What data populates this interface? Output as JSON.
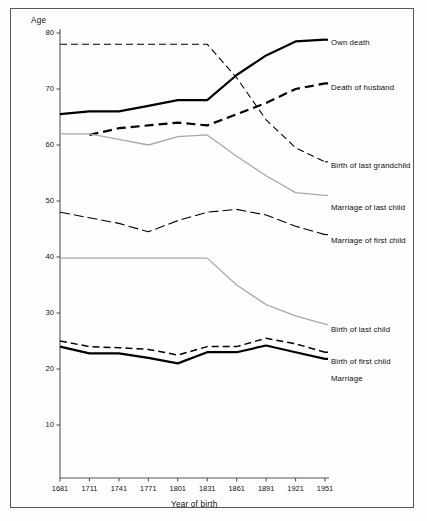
{
  "figure": {
    "background": "#fdfdfc",
    "frame_color": "#555555"
  },
  "chart_data": {
    "type": "line",
    "title": "",
    "xlabel": "Year of birth",
    "ylabel": "Age",
    "x": [
      1681,
      1711,
      1741,
      1771,
      1801,
      1831,
      1861,
      1891,
      1921,
      1951
    ],
    "categories": [
      "1681",
      "1711",
      "1741",
      "1771",
      "1801",
      "1831",
      "1861",
      "1891",
      "1921",
      "1951"
    ],
    "xlim": [
      1681,
      1951
    ],
    "ylim": [
      0,
      80
    ],
    "yticks": [
      10,
      20,
      30,
      40,
      50,
      60,
      70,
      80
    ],
    "ytick_labels": [
      "10",
      "20",
      "30",
      "40",
      "50",
      "60",
      "70",
      "80"
    ],
    "grid": false,
    "legend_position": "right-inline-labels",
    "series": [
      {
        "name": "Own death",
        "style": "solid-thick",
        "color": "#000000",
        "values": [
          65.5,
          66.0,
          66.0,
          67.0,
          68.0,
          68.0,
          72.5,
          76.0,
          78.5,
          78.8
        ]
      },
      {
        "name": "Death of husband",
        "style": "dashed-thick",
        "color": "#000000",
        "values": [
          null,
          61.8,
          63.0,
          63.5,
          64.0,
          63.5,
          65.5,
          67.5,
          70.0,
          71.0
        ]
      },
      {
        "name": "Birth of last grandchild",
        "style": "dashed-thin",
        "color": "#000000",
        "values": [
          78.0,
          78.0,
          78.0,
          78.0,
          78.0,
          78.0,
          72.0,
          64.5,
          59.5,
          57.0
        ]
      },
      {
        "name": "Marriage of last child",
        "style": "solid-thin-grey",
        "color": "#a8a8a8",
        "values": [
          62.0,
          62.0,
          61.0,
          60.0,
          61.5,
          61.8,
          58.0,
          54.5,
          51.5,
          51.0
        ]
      },
      {
        "name": "Marriage of first child",
        "style": "dash-dot",
        "color": "#000000",
        "values": [
          48.0,
          47.0,
          46.0,
          44.5,
          46.5,
          48.0,
          48.5,
          47.5,
          45.5,
          44.0
        ]
      },
      {
        "name": "Birth of last child",
        "style": "solid-thin-grey",
        "color": "#a8a8a8",
        "values": [
          39.8,
          39.8,
          39.8,
          39.8,
          39.8,
          39.8,
          35.0,
          31.5,
          29.5,
          28.0
        ]
      },
      {
        "name": "Birth of first child",
        "style": "dashed-medium",
        "color": "#000000",
        "values": [
          25.0,
          24.0,
          23.8,
          23.5,
          22.5,
          24.0,
          24.0,
          25.5,
          24.5,
          23.0
        ]
      },
      {
        "name": "Marriage",
        "style": "solid-thick",
        "color": "#000000",
        "values": [
          24.0,
          22.8,
          22.8,
          22.0,
          21.0,
          23.0,
          23.0,
          24.2,
          23.0,
          21.8
        ]
      }
    ]
  },
  "labels": {
    "own_death": "Own death",
    "death_of_husband": "Death of husband",
    "birth_of_last_grandchild": "Birth of last grandchild",
    "marriage_of_last_child": "Marriage of last child",
    "marriage_of_first_child": "Marriage of first child",
    "birth_of_last_child": "Birth of last child",
    "birth_of_first_child": "Birth of first child",
    "marriage": "Marriage"
  }
}
